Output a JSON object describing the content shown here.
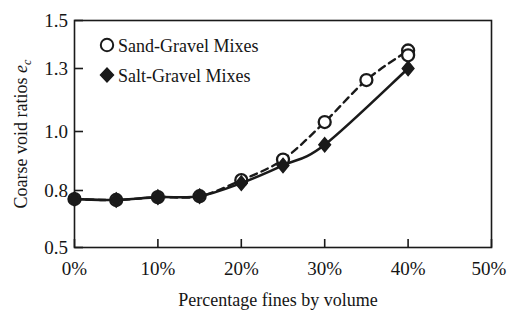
{
  "chart_data": {
    "type": "line",
    "title": "",
    "subtitle": "",
    "xlabel": "Percentage fines by volume",
    "ylabel": "Coarse void ratios e_c",
    "ylabel_main": "Coarse void ratios ",
    "ylabel_symbol": "e",
    "ylabel_subscript": "c",
    "xlim": [
      0,
      50
    ],
    "ylim": [
      0.5,
      1.5
    ],
    "grid": false,
    "legend_position": "upper-left",
    "x_ticks": [
      0,
      10,
      20,
      30,
      40,
      50
    ],
    "x_tick_labels": [
      "0%",
      "10%",
      "20%",
      "30%",
      "40%",
      "50%"
    ],
    "y_ticks": [
      0.5,
      0.8,
      1.0,
      1.3,
      1.5
    ],
    "y_tick_labels": [
      "0.5",
      "0.8",
      "1.0",
      "1.3",
      "1.5"
    ],
    "series": [
      {
        "name": "Sand-Gravel Mixes",
        "marker": "open-circle",
        "line_style": "dashed",
        "color": "#1a1a1a",
        "x": [
          0,
          5,
          10,
          15,
          20,
          25,
          30,
          35,
          40
        ],
        "values": [
          0.755,
          0.75,
          0.765,
          0.77,
          0.835,
          0.905,
          1.045,
          1.245,
          1.375
        ]
      },
      {
        "name": "Salt-Gravel Mixes",
        "marker": "filled-diamond",
        "line_style": "solid",
        "color": "#1a1a1a",
        "x": [
          0,
          5,
          10,
          15,
          20,
          25,
          30,
          40
        ],
        "values": [
          0.755,
          0.75,
          0.765,
          0.77,
          0.825,
          0.885,
          0.955,
          1.3
        ]
      }
    ],
    "legend": [
      {
        "label": "Sand-Gravel Mixes",
        "marker": "open-circle"
      },
      {
        "label": "Salt-Gravel Mixes",
        "marker": "filled-diamond"
      }
    ]
  },
  "axes": {
    "frame_color": "#1a1a1a"
  }
}
